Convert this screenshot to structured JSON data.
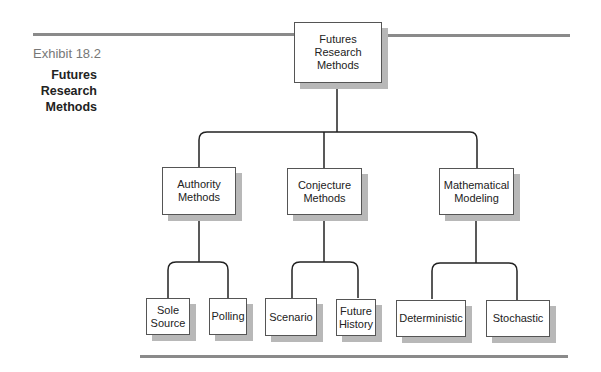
{
  "exhibit": {
    "label": "Exhibit 18.2",
    "title": "Futures Research Methods"
  },
  "root": {
    "label": "Futures Research Methods"
  },
  "branches": [
    {
      "label": "Authority Methods",
      "children": [
        {
          "label": "Sole Source"
        },
        {
          "label": "Polling"
        }
      ]
    },
    {
      "label": "Conjecture Methods",
      "children": [
        {
          "label": "Scenario"
        },
        {
          "label": "Future History"
        }
      ]
    },
    {
      "label": "Mathematical Modeling",
      "children": [
        {
          "label": "Deterministic"
        },
        {
          "label": "Stochastic"
        }
      ]
    }
  ],
  "colors": {
    "rule": "#8a8a8a",
    "line": "#222222",
    "shadow": "#b8b8b8"
  }
}
